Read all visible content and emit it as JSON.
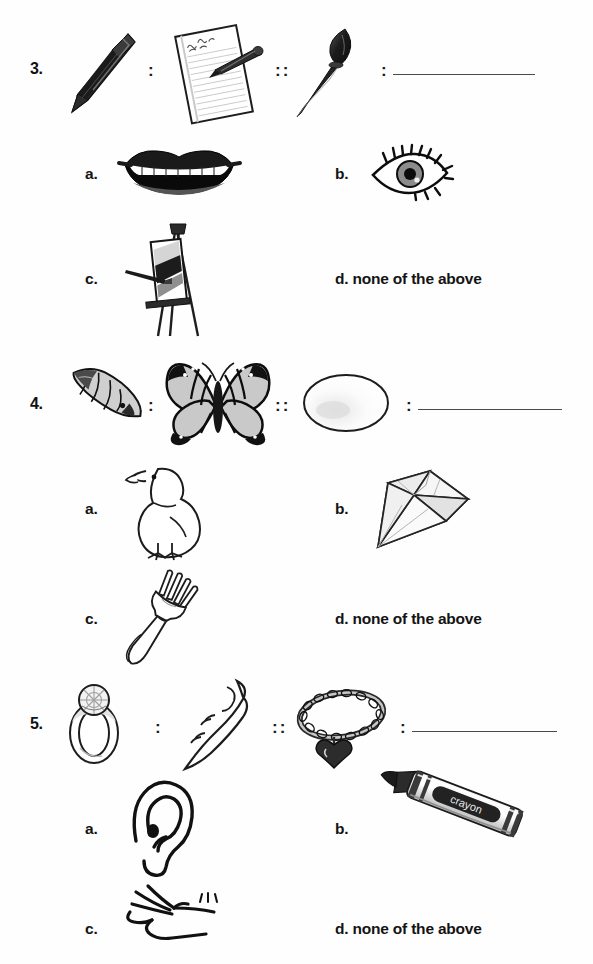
{
  "worksheet": {
    "type": "picture-analogy-multiple-choice",
    "answer_option_d_text": "d. none of the above",
    "separator_single": ":",
    "separator_double": "::"
  },
  "questions": [
    {
      "number": "3.",
      "prompt": {
        "term1": {
          "label": "pen",
          "icon": "pen-icon"
        },
        "sep1": ":",
        "term2": {
          "label": "notepad",
          "icon": "notepad-with-pen-icon"
        },
        "sep2": "::",
        "term3": {
          "label": "paintbrush",
          "icon": "paintbrush-icon"
        },
        "sep3": ":",
        "answer_blank": ""
      },
      "options": [
        {
          "letter": "a.",
          "label": "mouth",
          "icon": "mouth-icon",
          "text": ""
        },
        {
          "letter": "b.",
          "label": "eye",
          "icon": "eye-icon",
          "text": ""
        },
        {
          "letter": "c.",
          "label": "easel with canvas",
          "icon": "easel-icon",
          "text": ""
        },
        {
          "letter": "d.",
          "label": "none of the above",
          "icon": "",
          "text": "d. none of the above"
        }
      ]
    },
    {
      "number": "4.",
      "prompt": {
        "term1": {
          "label": "caterpillar",
          "icon": "caterpillar-icon"
        },
        "sep1": ":",
        "term2": {
          "label": "butterfly",
          "icon": "butterfly-icon"
        },
        "sep2": "::",
        "term3": {
          "label": "egg",
          "icon": "egg-icon"
        },
        "sep3": ":",
        "answer_blank": ""
      },
      "options": [
        {
          "letter": "a.",
          "label": "chick",
          "icon": "chick-icon",
          "text": ""
        },
        {
          "letter": "b.",
          "label": "diamond",
          "icon": "diamond-icon",
          "text": ""
        },
        {
          "letter": "c.",
          "label": "fork",
          "icon": "fork-icon",
          "text": ""
        },
        {
          "letter": "d.",
          "label": "none of the above",
          "icon": "",
          "text": "d. none of the above"
        }
      ]
    },
    {
      "number": "5.",
      "prompt": {
        "term1": {
          "label": "ring",
          "icon": "ring-icon"
        },
        "sep1": ":",
        "term2": {
          "label": "finger",
          "icon": "finger-icon"
        },
        "sep2": "::",
        "term3": {
          "label": "bracelet",
          "icon": "bracelet-icon"
        },
        "sep3": ":",
        "answer_blank": ""
      },
      "options": [
        {
          "letter": "a.",
          "label": "ear",
          "icon": "ear-icon",
          "text": ""
        },
        {
          "letter": "b.",
          "label": "crayon",
          "icon": "crayon-icon",
          "text": "",
          "crayon_label": "crayon"
        },
        {
          "letter": "c.",
          "label": "hand and wrist",
          "icon": "hand-icon",
          "text": ""
        },
        {
          "letter": "d.",
          "label": "none of the above",
          "icon": "",
          "text": "d. none of the above"
        }
      ]
    }
  ],
  "colors": {
    "ink": "#1a1a1a",
    "line": "#4a4a4a",
    "paper": "#fefefe",
    "shade_light": "#d8d8d8",
    "shade_mid": "#9a9a9a",
    "shade_dark": "#3a3a3a"
  }
}
